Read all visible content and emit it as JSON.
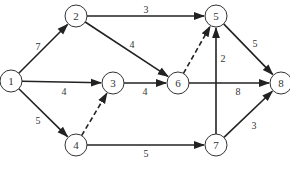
{
  "diagram": {
    "type": "directed-network",
    "style": {
      "edge_color": "#222222",
      "node_stroke": "#333333",
      "background": "#ffffff"
    },
    "nodes": [
      {
        "id": "1",
        "label": "1",
        "x": 11,
        "y": 81
      },
      {
        "id": "2",
        "label": "2",
        "x": 76,
        "y": 16
      },
      {
        "id": "3",
        "label": "3",
        "x": 113,
        "y": 83
      },
      {
        "id": "4",
        "label": "4",
        "x": 76,
        "y": 145
      },
      {
        "id": "5",
        "label": "5",
        "x": 216,
        "y": 16
      },
      {
        "id": "6",
        "label": "6",
        "x": 178,
        "y": 83
      },
      {
        "id": "7",
        "label": "7",
        "x": 216,
        "y": 145
      },
      {
        "id": "8",
        "label": "8",
        "x": 281,
        "y": 83
      }
    ],
    "edges": [
      {
        "from": "1",
        "to": "2",
        "weight": "7",
        "dashed": false,
        "lx": 38,
        "ly": 46
      },
      {
        "from": "1",
        "to": "3",
        "weight": "4",
        "dashed": false,
        "lx": 64,
        "ly": 91
      },
      {
        "from": "1",
        "to": "4",
        "weight": "5",
        "dashed": false,
        "lx": 38,
        "ly": 120
      },
      {
        "from": "2",
        "to": "5",
        "weight": "3",
        "dashed": false,
        "lx": 146,
        "ly": 9
      },
      {
        "from": "2",
        "to": "6",
        "weight": "4",
        "dashed": false,
        "lx": 132,
        "ly": 44
      },
      {
        "from": "4",
        "to": "3",
        "weight": "",
        "dashed": true,
        "lx": 0,
        "ly": 0
      },
      {
        "from": "3",
        "to": "6",
        "weight": "4",
        "dashed": false,
        "lx": 145,
        "ly": 91
      },
      {
        "from": "6",
        "to": "5",
        "weight": "",
        "dashed": true,
        "lx": 0,
        "ly": 0
      },
      {
        "from": "6",
        "to": "8",
        "weight": "8",
        "dashed": false,
        "lx": 238,
        "ly": 91
      },
      {
        "from": "7",
        "to": "5",
        "weight": "2",
        "dashed": false,
        "lx": 223,
        "ly": 58
      },
      {
        "from": "5",
        "to": "8",
        "weight": "5",
        "dashed": false,
        "lx": 255,
        "ly": 43
      },
      {
        "from": "4",
        "to": "7",
        "weight": "5",
        "dashed": false,
        "lx": 146,
        "ly": 153
      },
      {
        "from": "7",
        "to": "8",
        "weight": "3",
        "dashed": false,
        "lx": 254,
        "ly": 125
      }
    ]
  }
}
